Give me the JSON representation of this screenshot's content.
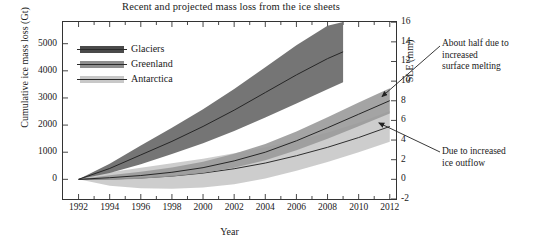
{
  "chart_data": {
    "type": "area",
    "title": "Recent and projected mass loss from the ice sheets",
    "xlabel": "Year",
    "ylabel": "Cumulative ice mass loss (Gt)",
    "y2label": "SLE (mm)",
    "xlim": [
      1991,
      2012.4
    ],
    "ylim": [
      -725,
      5800
    ],
    "y2lim": [
      -2,
      16
    ],
    "xticks": [
      1992,
      1994,
      1996,
      1998,
      2000,
      2002,
      2004,
      2006,
      2008,
      2010,
      2012
    ],
    "xtick_labels": [
      "1992",
      "1994",
      "1996",
      "1998",
      "2000",
      "2002",
      "2004",
      "2006",
      "2008",
      "2010",
      "2012"
    ],
    "xminor_step": 1,
    "yticks": [
      0,
      1000,
      2000,
      3000,
      4000,
      5000
    ],
    "ytick_labels": [
      "0",
      "1000",
      "2000",
      "3000",
      "4000",
      "5000"
    ],
    "y2ticks": [
      -2,
      0,
      2,
      4,
      6,
      8,
      10,
      12,
      14,
      16
    ],
    "y2tick_labels": [
      "-2",
      "0",
      "2",
      "4",
      "6",
      "8",
      "10",
      "12",
      "14",
      "16"
    ],
    "grid": false,
    "legend_position": "upper-left",
    "gt_per_mm_sle": 362,
    "series": [
      {
        "name": "Glaciers",
        "color": "#4a4a4a",
        "band_color": "#6e6e6e",
        "line_color": "#262626",
        "x": [
          1992,
          1994,
          1996,
          1998,
          2000,
          2002,
          2004,
          2006,
          2008,
          2009
        ],
        "values": [
          0,
          400,
          900,
          1400,
          1950,
          2550,
          3200,
          3850,
          4450,
          4700
        ],
        "lower": [
          0,
          230,
          560,
          930,
          1330,
          1780,
          2280,
          2800,
          3320,
          3580
        ],
        "upper": [
          0,
          570,
          1250,
          1900,
          2580,
          3330,
          4130,
          4940,
          5660,
          5800
        ]
      },
      {
        "name": "Greenland",
        "color": "#8f8f8f",
        "band_color": "#9a9a9a",
        "line_color": "#262626",
        "x": [
          1992,
          1994,
          1996,
          1998,
          2000,
          2002,
          2004,
          2006,
          2008,
          2010,
          2012
        ],
        "values": [
          0,
          60,
          140,
          260,
          430,
          680,
          1000,
          1420,
          1900,
          2400,
          2900
        ],
        "lower": [
          0,
          -20,
          20,
          100,
          230,
          430,
          700,
          1070,
          1500,
          1960,
          2430
        ],
        "upper": [
          0,
          150,
          280,
          440,
          650,
          940,
          1300,
          1760,
          2290,
          2830,
          3360
        ]
      },
      {
        "name": "Antarctica",
        "color": "#c8c8c8",
        "band_color": "#c8c8c8",
        "line_color": "#2e2e2e",
        "x": [
          1992,
          1994,
          1996,
          1998,
          2000,
          2002,
          2004,
          2006,
          2008,
          2010,
          2012
        ],
        "values": [
          0,
          10,
          50,
          120,
          230,
          390,
          600,
          870,
          1180,
          1540,
          1950
        ],
        "lower": [
          0,
          -240,
          -330,
          -350,
          -300,
          -180,
          30,
          320,
          640,
          1000,
          1390
        ],
        "upper": [
          0,
          260,
          430,
          590,
          760,
          960,
          1180,
          1440,
          1730,
          2090,
          2520
        ]
      }
    ],
    "annotations": [
      {
        "name": "surface-melting-note",
        "lines": [
          "About half due to",
          "increased",
          "surface melting"
        ],
        "arrow_to_x": 2011.5,
        "arrow_to_y": 3050
      },
      {
        "name": "ice-outflow-note",
        "lines": [
          "Due to increased",
          "ice outflow"
        ],
        "arrow_to_x": 2011.3,
        "arrow_to_y": 2080
      }
    ]
  },
  "legend": {
    "items": [
      {
        "label": "Glaciers"
      },
      {
        "label": "Greenland"
      },
      {
        "label": "Antarctica"
      }
    ]
  }
}
